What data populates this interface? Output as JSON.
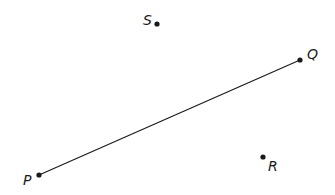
{
  "diagram": {
    "background": "#ffffff",
    "stroke_color": "#1a1a1a",
    "points": [
      {
        "id": "S",
        "label": "S",
        "x": 157,
        "y": 24,
        "label_x": 143,
        "label_y": 25
      },
      {
        "id": "Q",
        "label": "Q",
        "x": 300,
        "y": 60,
        "label_x": 307,
        "label_y": 59
      },
      {
        "id": "P",
        "label": "P",
        "x": 39,
        "y": 175,
        "label_x": 23,
        "label_y": 185
      },
      {
        "id": "R",
        "label": "R",
        "x": 263,
        "y": 157,
        "label_x": 268,
        "label_y": 171
      }
    ],
    "segments": [
      {
        "from": "P",
        "to": "Q"
      }
    ]
  }
}
